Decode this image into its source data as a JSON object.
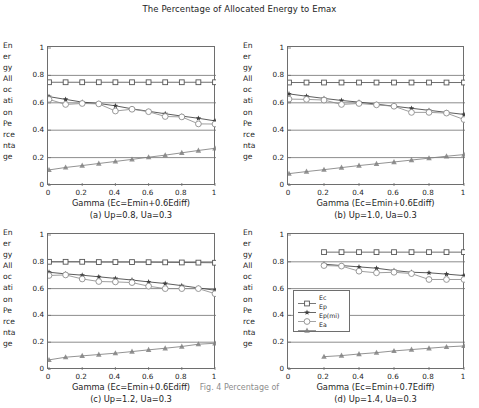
{
  "figure": {
    "title": "The Percentage of Allocated Energy to Emax",
    "ylabel_lines": [
      "En",
      "er",
      "gy",
      "All",
      "oc",
      "ati",
      "on",
      "Pe",
      "rce",
      "nta",
      "ge"
    ],
    "ylabel_full": "Energy Allocation Percentage",
    "caption": "Fig. 4 Percentage of"
  },
  "legend": {
    "position": "panel-d-left",
    "entries": [
      {
        "label": "Ec",
        "marker": "open-square",
        "color": "#4a4a4a"
      },
      {
        "label": "Ep",
        "marker": "filled-star",
        "color": "#4a4a4a"
      },
      {
        "label": "Ep(mi)",
        "marker": "open-circle",
        "color": "#8a8a8a"
      },
      {
        "label": "Ea",
        "marker": "filled-triangle",
        "color": "#7a7a7a"
      }
    ]
  },
  "axis": {
    "ytick_labels": [
      "0",
      "0.2",
      "0.4",
      "0.6",
      "0.8",
      "1"
    ],
    "ytick_values": [
      0,
      0.2,
      0.4,
      0.6,
      0.8,
      1
    ],
    "xtick_labels": [
      "0",
      "0.2",
      "0.4",
      "0.6",
      "0.8",
      "1"
    ],
    "xtick_values": [
      0,
      0.2,
      0.4,
      0.6,
      0.8,
      1
    ],
    "xlim": [
      0,
      1
    ],
    "ylim": [
      0,
      1
    ],
    "grid": "horizontal"
  },
  "chart_data": [
    {
      "id": "a",
      "type": "line",
      "title": "(a) Up=0.8, Ua=0.3",
      "xlabel": "Gamma (Ec=Emin+0.6Ediff)",
      "ylabel": "Energy Allocation Percentage",
      "xlim": [
        0,
        1
      ],
      "ylim": [
        0,
        1
      ],
      "grid": true,
      "legend_position": "none",
      "x": [
        0,
        0.1,
        0.2,
        0.3,
        0.4,
        0.5,
        0.6,
        0.7,
        0.8,
        0.9,
        1.0
      ],
      "series": [
        {
          "name": "Ec",
          "marker": "open-square",
          "values": [
            0.75,
            0.75,
            0.75,
            0.75,
            0.75,
            0.75,
            0.75,
            0.75,
            0.75,
            0.75,
            0.75
          ]
        },
        {
          "name": "Ep",
          "marker": "filled-star",
          "values": [
            0.645,
            0.625,
            0.605,
            0.595,
            0.578,
            0.556,
            0.538,
            0.52,
            0.503,
            0.487,
            0.468
          ]
        },
        {
          "name": "Ep(mi)",
          "marker": "open-circle",
          "values": [
            0.625,
            0.588,
            0.595,
            0.592,
            0.54,
            0.553,
            0.535,
            0.5,
            0.497,
            0.446,
            0.445
          ]
        },
        {
          "name": "Ea",
          "marker": "filled-triangle",
          "values": [
            0.11,
            0.128,
            0.142,
            0.157,
            0.172,
            0.187,
            0.203,
            0.218,
            0.235,
            0.252,
            0.268
          ]
        }
      ]
    },
    {
      "id": "b",
      "type": "line",
      "title": "(b) Up=1.0, Ua=0.3",
      "xlabel": "Gamma (Ec=Emin+0.6Ediff)",
      "ylabel": "Energy Allocation Percentage",
      "xlim": [
        0,
        1
      ],
      "ylim": [
        0,
        1
      ],
      "grid": true,
      "legend_position": "none",
      "x": [
        0,
        0.1,
        0.2,
        0.3,
        0.4,
        0.5,
        0.6,
        0.7,
        0.8,
        0.9,
        1.0
      ],
      "series": [
        {
          "name": "Ec",
          "marker": "open-square",
          "values": [
            0.748,
            0.748,
            0.748,
            0.748,
            0.748,
            0.748,
            0.748,
            0.748,
            0.748,
            0.748,
            0.748
          ]
        },
        {
          "name": "Ep",
          "marker": "filled-star",
          "values": [
            0.665,
            0.648,
            0.632,
            0.617,
            0.605,
            0.59,
            0.575,
            0.56,
            0.545,
            0.53,
            0.515
          ]
        },
        {
          "name": "Ep(mi)",
          "marker": "open-circle",
          "values": [
            0.627,
            0.625,
            0.62,
            0.588,
            0.595,
            0.585,
            0.575,
            0.53,
            0.53,
            0.525,
            0.478
          ]
        },
        {
          "name": "Ea",
          "marker": "filled-triangle",
          "values": [
            0.083,
            0.098,
            0.112,
            0.127,
            0.142,
            0.155,
            0.168,
            0.182,
            0.196,
            0.21,
            0.222
          ]
        }
      ]
    },
    {
      "id": "c",
      "type": "line",
      "title": "(c) Up=1.2, Ua=0.3",
      "xlabel": "Gamma (Ec=Emin+0.6Ediff)",
      "ylabel": "Energy Allocation Percentage",
      "xlim": [
        0,
        1
      ],
      "ylim": [
        0,
        1
      ],
      "grid": true,
      "legend_position": "none",
      "x": [
        0,
        0.1,
        0.2,
        0.3,
        0.4,
        0.5,
        0.6,
        0.7,
        0.8,
        0.9,
        1.0
      ],
      "series": [
        {
          "name": "Ec",
          "marker": "open-square",
          "values": [
            0.8,
            0.8,
            0.8,
            0.798,
            0.798,
            0.798,
            0.797,
            0.796,
            0.795,
            0.794,
            0.793
          ]
        },
        {
          "name": "Ep",
          "marker": "filled-star",
          "values": [
            0.722,
            0.71,
            0.7,
            0.688,
            0.676,
            0.664,
            0.65,
            0.638,
            0.622,
            0.605,
            0.588
          ]
        },
        {
          "name": "Ep(mi)",
          "marker": "open-circle",
          "values": [
            0.698,
            0.702,
            0.672,
            0.653,
            0.65,
            0.645,
            0.618,
            0.6,
            0.6,
            0.6,
            0.562
          ]
        },
        {
          "name": "Ea",
          "marker": "filled-triangle",
          "values": [
            0.068,
            0.088,
            0.098,
            0.108,
            0.118,
            0.13,
            0.143,
            0.155,
            0.168,
            0.185,
            0.192
          ]
        }
      ]
    },
    {
      "id": "d",
      "type": "line",
      "title": "(d) Up=1.4, Ua=0.3",
      "xlabel": "Gamma (Ec=Emin+0.7Ediff)",
      "ylabel": "Energy Allocation Percentage",
      "xlim": [
        0,
        1
      ],
      "ylim": [
        0,
        1
      ],
      "grid": true,
      "legend_position": "center-left",
      "x": [
        0.2,
        0.3,
        0.4,
        0.5,
        0.6,
        0.7,
        0.8,
        0.9,
        1.0
      ],
      "series": [
        {
          "name": "Ec",
          "marker": "open-square",
          "values": [
            0.872,
            0.872,
            0.872,
            0.872,
            0.872,
            0.872,
            0.872,
            0.872,
            0.872
          ]
        },
        {
          "name": "Ep",
          "marker": "filled-star",
          "values": [
            0.782,
            0.772,
            0.762,
            0.752,
            0.735,
            0.722,
            0.718,
            0.708,
            0.697
          ]
        },
        {
          "name": "Ep(mi)",
          "marker": "open-circle",
          "values": [
            0.772,
            0.768,
            0.73,
            0.718,
            0.722,
            0.712,
            0.668,
            0.668,
            0.668
          ]
        },
        {
          "name": "Ea",
          "marker": "filled-triangle",
          "values": [
            0.092,
            0.1,
            0.112,
            0.122,
            0.135,
            0.145,
            0.155,
            0.165,
            0.172
          ]
        }
      ]
    }
  ]
}
